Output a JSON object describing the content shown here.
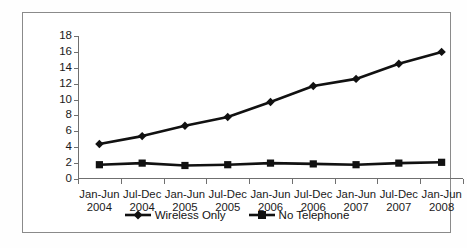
{
  "chart_data": {
    "type": "line",
    "title": "",
    "xlabel": "",
    "ylabel": "",
    "ylim": [
      0,
      18
    ],
    "ytick_step": 2,
    "grid": false,
    "legend_position": "bottom",
    "categories": [
      "Jan-Jun 2004",
      "Jul-Dec 2004",
      "Jan-Jun 2005",
      "Jul-Dec 2005",
      "Jan-Jun 2006",
      "Jul-Dec 2006",
      "Jan-Jun 2007",
      "Jul-Dec 2007",
      "Jan-Jun 2008"
    ],
    "category_lines": [
      [
        "Jan-Jun",
        "2004"
      ],
      [
        "Jul-Dec",
        "2004"
      ],
      [
        "Jan-Jun",
        "2005"
      ],
      [
        "Jul-Dec",
        "2005"
      ],
      [
        "Jan-Jun",
        "2006"
      ],
      [
        "Jul-Dec",
        "2006"
      ],
      [
        "Jan-Jun",
        "2007"
      ],
      [
        "Jul-Dec",
        "2007"
      ],
      [
        "Jan-Jun",
        "2008"
      ]
    ],
    "ytick_labels": [
      "0",
      "2",
      "4",
      "6",
      "8",
      "10",
      "12",
      "14",
      "16",
      "18"
    ],
    "ytick_values": [
      0,
      2,
      4,
      6,
      8,
      10,
      12,
      14,
      16,
      18
    ],
    "series": [
      {
        "name": "Wireless Only",
        "marker": "diamond",
        "color": "#111111",
        "values": [
          4.4,
          5.4,
          6.7,
          7.8,
          9.7,
          11.7,
          12.6,
          14.5,
          16.0
        ]
      },
      {
        "name": "No Telephone",
        "marker": "square",
        "color": "#111111",
        "values": [
          1.8,
          2.0,
          1.7,
          1.8,
          2.0,
          1.9,
          1.8,
          2.0,
          2.1
        ]
      }
    ]
  },
  "legend": {
    "items": [
      {
        "label": "Wireless Only",
        "marker": "diamond-marker-icon"
      },
      {
        "label": "No Telephone",
        "marker": "square-marker-icon"
      }
    ]
  }
}
